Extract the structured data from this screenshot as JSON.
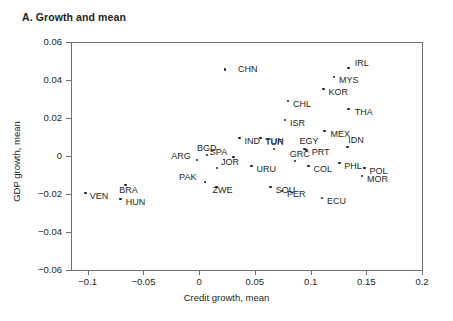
{
  "panel": {
    "title": "A. Growth and mean"
  },
  "chart_data": {
    "type": "scatter",
    "title": "A. Growth and mean",
    "xlabel": "Credit growth, mean",
    "ylabel": "GDP growth, mean",
    "xlim": [
      -0.115,
      0.2
    ],
    "ylim": [
      -0.06,
      0.06
    ],
    "xticks": [
      -0.1,
      -0.05,
      0,
      0.05,
      0.1,
      0.15,
      0.2
    ],
    "xtick_labels": [
      "−0.1",
      "−0.05",
      "0",
      "0.05",
      "0.1",
      "0.15",
      "0.2"
    ],
    "yticks": [
      -0.06,
      -0.04,
      -0.02,
      0,
      0.02,
      0.04,
      0.06
    ],
    "ytick_labels": [
      "−0.06",
      "−0.04",
      "−0.02",
      "0",
      "0.02",
      "0.04",
      "0.06"
    ],
    "grid": false,
    "legend": "none",
    "points": [
      {
        "label": "CHN",
        "x": 0.0232,
        "y": 0.0455,
        "lx": 13,
        "ly": -5
      },
      {
        "label": "IRL",
        "x": 0.1343,
        "y": 0.0463,
        "lx": 6,
        "ly": -9
      },
      {
        "label": "MYS",
        "x": 0.121,
        "y": 0.0415,
        "lx": 5,
        "ly": -1
      },
      {
        "label": "KOR",
        "x": 0.1117,
        "y": 0.0353,
        "lx": 5,
        "ly": -1
      },
      {
        "label": "CHL",
        "x": 0.0797,
        "y": 0.029,
        "lx": 5,
        "ly": -1
      },
      {
        "label": "THA",
        "x": 0.1343,
        "y": 0.0247,
        "lx": 6,
        "ly": -1
      },
      {
        "label": "ISR",
        "x": 0.077,
        "y": 0.019,
        "lx": 5,
        "ly": -1
      },
      {
        "label": "MEX",
        "x": 0.1126,
        "y": 0.0132,
        "lx": 6,
        "ly": -1
      },
      {
        "label": "IND",
        "x": 0.0363,
        "y": 0.0095,
        "lx": 5,
        "ly": -1
      },
      {
        "label": "TUN",
        "x": 0.0549,
        "y": 0.0095,
        "lx": 5,
        "ly": -1
      },
      {
        "label": "IDN",
        "x": 0.1329,
        "y": 0.0047,
        "lx": 1,
        "ly": -11
      },
      {
        "label": "TUR",
        "x": 0.0673,
        "y": 0.0037,
        "lx": -9,
        "ly": -11
      },
      {
        "label": "EGY",
        "x": 0.0946,
        "y": 0.0037,
        "lx": -5,
        "ly": -12
      },
      {
        "label": "PRT",
        "x": 0.0966,
        "y": 0.0032,
        "lx": 5,
        "ly": -2
      },
      {
        "label": "BGD",
        "x": 0.0071,
        "y": 0.0005,
        "lx": -10,
        "ly": -11
      },
      {
        "label": "SPA",
        "x": 0.0311,
        "y": -0.0005,
        "lx": -24,
        "ly": -9
      },
      {
        "label": "ARG",
        "x": -0.0018,
        "y": -0.0021,
        "lx": -26,
        "ly": -8
      },
      {
        "label": "GRC",
        "x": 0.0859,
        "y": -0.0026,
        "lx": -5,
        "ly": -11
      },
      {
        "label": "PHL",
        "x": 0.1257,
        "y": -0.0037,
        "lx": 5,
        "ly": -1
      },
      {
        "label": "URU",
        "x": 0.047,
        "y": -0.0053,
        "lx": 5,
        "ly": -1
      },
      {
        "label": "COL",
        "x": 0.0982,
        "y": -0.0053,
        "lx": 5,
        "ly": -1
      },
      {
        "label": "JOR",
        "x": 0.016,
        "y": -0.0063,
        "lx": 4,
        "ly": -10
      },
      {
        "label": "POL",
        "x": 0.1483,
        "y": -0.0063,
        "lx": 5,
        "ly": -1
      },
      {
        "label": "MOR",
        "x": 0.1461,
        "y": -0.0105,
        "lx": 5,
        "ly": -1
      },
      {
        "label": "PAK",
        "x": 0.0053,
        "y": -0.0137,
        "lx": -26,
        "ly": -9
      },
      {
        "label": "ZWE",
        "x": 0.0155,
        "y": -0.0163,
        "lx": -4,
        "ly": -1
      },
      {
        "label": "SOU",
        "x": 0.0642,
        "y": -0.0163,
        "lx": 5,
        "ly": -1
      },
      {
        "label": "PER",
        "x": 0.0744,
        "y": -0.0184,
        "lx": 5,
        "ly": -1
      },
      {
        "label": "VEN",
        "x": -0.1018,
        "y": -0.0195,
        "lx": 4,
        "ly": -1
      },
      {
        "label": "BRA",
        "x": -0.0663,
        "y": -0.0153,
        "lx": -6,
        "ly": 1
      },
      {
        "label": "ECU",
        "x": 0.1102,
        "y": -0.0221,
        "lx": 5,
        "ly": -1
      },
      {
        "label": "HUN",
        "x": -0.0704,
        "y": -0.0226,
        "lx": 5,
        "ly": -1
      }
    ]
  }
}
